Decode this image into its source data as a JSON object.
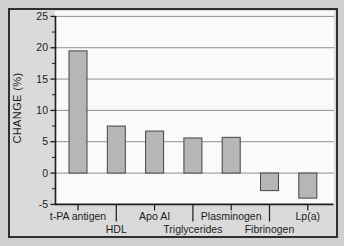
{
  "chart_data": {
    "type": "bar",
    "title": "",
    "xlabel": "",
    "ylabel": "CHANGE (%)",
    "categories": [
      "t-PA antigen",
      "HDL",
      "Apo AI",
      "Triglycerides",
      "Plasminogen",
      "Fibrinogen",
      "Lp(a)"
    ],
    "values": [
      19.5,
      7.5,
      6.7,
      5.6,
      5.7,
      -2.8,
      -4.0
    ],
    "label_rows": [
      1,
      2,
      1,
      2,
      1,
      2,
      1
    ],
    "ylim": [
      -5,
      25
    ],
    "yticks": [
      -5,
      0,
      5,
      10,
      15,
      20,
      25
    ],
    "ytick_labels": [
      "-5",
      "0",
      "5",
      "10",
      "15",
      "20",
      "25"
    ],
    "yminor_step": 2.5,
    "grid": true,
    "legend": "none",
    "colors": {
      "page_bg": "#cfcfcf",
      "panel_bg": "#dadada",
      "frame": "#2f2f2f",
      "plot_bg": "#fafafa",
      "grid": "#909090",
      "axis": "#1c1c1c",
      "bar_fill": "#b6b6b6",
      "bar_stroke": "#454545",
      "text": "#1c1c1c"
    }
  }
}
